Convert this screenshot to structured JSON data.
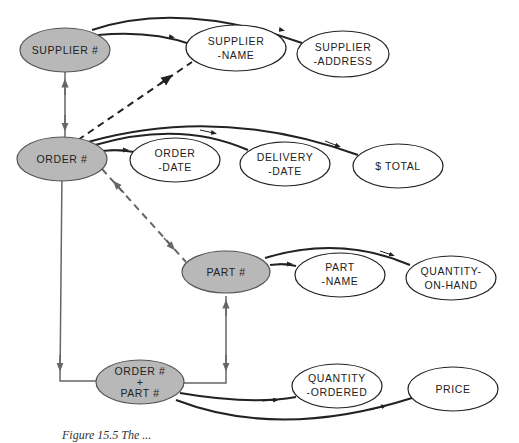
{
  "diagram": {
    "colors": {
      "key_fill": "#b8b8b8",
      "attr_fill": "#ffffff",
      "stroke": "#222222",
      "gray_link": "#666666"
    },
    "nodes": {
      "supplier_key": {
        "lines": [
          "SUPPLIER #"
        ],
        "type": "key"
      },
      "supplier_name": {
        "lines": [
          "SUPPLIER",
          "-NAME"
        ],
        "type": "attribute"
      },
      "supplier_address": {
        "lines": [
          "SUPPLIER",
          "-ADDRESS"
        ],
        "type": "attribute"
      },
      "order_key": {
        "lines": [
          "ORDER #"
        ],
        "type": "key"
      },
      "order_date": {
        "lines": [
          "ORDER",
          "-DATE"
        ],
        "type": "attribute"
      },
      "delivery_date": {
        "lines": [
          "DELIVERY",
          "-DATE"
        ],
        "type": "attribute"
      },
      "total": {
        "lines": [
          "$ TOTAL"
        ],
        "type": "attribute"
      },
      "part_key": {
        "lines": [
          "PART #"
        ],
        "type": "key"
      },
      "part_name": {
        "lines": [
          "PART",
          "-NAME"
        ],
        "type": "attribute"
      },
      "quantity_on_hand": {
        "lines": [
          "QUANTITY-",
          "ON-HAND"
        ],
        "type": "attribute"
      },
      "order_part_key": {
        "lines": [
          "ORDER #",
          "+",
          "PART #"
        ],
        "type": "key"
      },
      "quantity_ordered": {
        "lines": [
          "QUANTITY",
          "-ORDERED"
        ],
        "type": "attribute"
      },
      "price": {
        "lines": [
          "PRICE"
        ],
        "type": "attribute"
      }
    },
    "edges": [
      {
        "from": "SUPPLIER #",
        "to": "SUPPLIER-NAME",
        "style": "solid"
      },
      {
        "from": "SUPPLIER #",
        "to": "SUPPLIER-ADDRESS",
        "style": "solid"
      },
      {
        "from": "SUPPLIER #",
        "to": "ORDER #",
        "style": "gray-bidirectional"
      },
      {
        "from": "ORDER #",
        "to": "SUPPLIER-NAME",
        "style": "dashed"
      },
      {
        "from": "ORDER #",
        "to": "ORDER-DATE",
        "style": "solid"
      },
      {
        "from": "ORDER #",
        "to": "DELIVERY-DATE",
        "style": "solid"
      },
      {
        "from": "ORDER #",
        "to": "$ TOTAL",
        "style": "solid"
      },
      {
        "from": "ORDER #",
        "to": "PART #",
        "style": "gray-dashed-bidirectional"
      },
      {
        "from": "PART #",
        "to": "PART-NAME",
        "style": "solid"
      },
      {
        "from": "PART #",
        "to": "QUANTITY-ON-HAND",
        "style": "solid"
      },
      {
        "from": "ORDER #",
        "to": "ORDER # + PART #",
        "style": "gray"
      },
      {
        "from": "PART #",
        "to": "ORDER # + PART #",
        "style": "gray"
      },
      {
        "from": "ORDER # + PART #",
        "to": "QUANTITY-ORDERED",
        "style": "solid"
      },
      {
        "from": "ORDER # + PART #",
        "to": "PRICE",
        "style": "solid"
      }
    ],
    "caption": "Figure 15.5  The ..."
  }
}
